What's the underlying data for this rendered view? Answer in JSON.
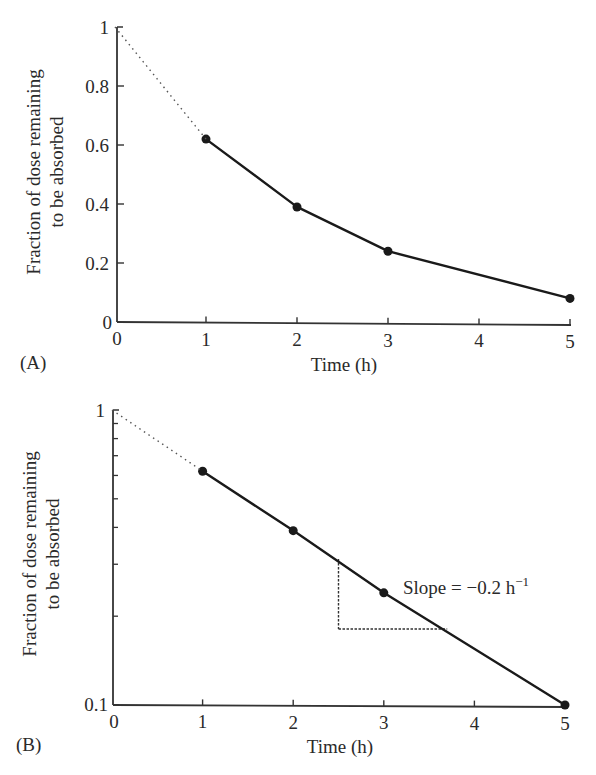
{
  "chart_data": [
    {
      "panel": "(A)",
      "type": "line",
      "title": "",
      "xlabel": "Time (h)",
      "ylabel": [
        "Fraction of dose remaining",
        "to be absorbed"
      ],
      "xlim": [
        0,
        5
      ],
      "ylim": [
        0,
        1
      ],
      "yscale": "linear",
      "xticks": [
        "0",
        "1",
        "2",
        "3",
        "4",
        "5"
      ],
      "yticks": [
        "0",
        "0.2",
        "0.4",
        "0.6",
        "0.8",
        "1"
      ],
      "grid": false,
      "series": [
        {
          "name": "observed",
          "style": "solid",
          "markers": true,
          "x": [
            1,
            2,
            3,
            5
          ],
          "y": [
            0.62,
            0.39,
            0.24,
            0.08
          ]
        },
        {
          "name": "extrapolated",
          "style": "dotted",
          "markers": false,
          "x": [
            0,
            1
          ],
          "y": [
            1.0,
            0.62
          ]
        }
      ]
    },
    {
      "panel": "(B)",
      "type": "line",
      "title": "",
      "xlabel": "Time (h)",
      "ylabel": [
        "Fraction of dose remaining",
        "to be absorbed"
      ],
      "xlim": [
        0,
        5
      ],
      "ylim": [
        0.1,
        1
      ],
      "yscale": "log",
      "xticks": [
        "0",
        "1",
        "2",
        "3",
        "4",
        "5"
      ],
      "yticks": [
        "0.1",
        "1"
      ],
      "grid": false,
      "series": [
        {
          "name": "observed",
          "style": "solid",
          "markers": true,
          "x": [
            1,
            2,
            3,
            5
          ],
          "y": [
            0.62,
            0.39,
            0.24,
            0.1
          ]
        },
        {
          "name": "extrapolated",
          "style": "dotted",
          "markers": false,
          "x": [
            0,
            1
          ],
          "y": [
            1.0,
            0.62
          ]
        }
      ],
      "annotations": [
        {
          "text": "Slope = −0.2 h",
          "superscript": "−1",
          "x": 3.2,
          "y": 0.24
        },
        {
          "type": "slope-triangle",
          "x_from": 2.5,
          "x_to": 3.7,
          "style": "dashed"
        }
      ]
    }
  ],
  "labels": {
    "panel_a": "(A)",
    "panel_b": "(B)",
    "xlabel": "Time (h)",
    "ylabel_line1": "Fraction of dose remaining",
    "ylabel_line2": "to be absorbed",
    "slope_text": "Slope = −0.2 h",
    "slope_sup": "−1",
    "x_zero": "0",
    "a_y_zero": "0",
    "b_y_min": "0.1",
    "b_y_max": "1"
  },
  "colors": {
    "ink": "#1a1a1a",
    "axis": "#333333",
    "background": "#ffffff"
  }
}
